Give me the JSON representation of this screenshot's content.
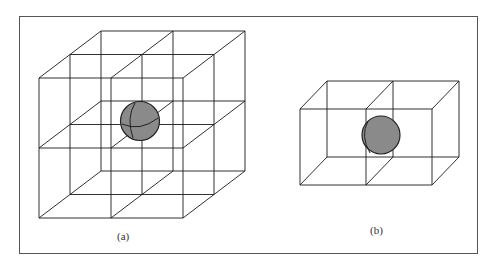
{
  "figure": {
    "panels": [
      {
        "id": "a",
        "caption": "(a)",
        "description": "2x2x2 cubic lattice with sphere at center vertex",
        "lattice": {
          "nx": 2,
          "ny": 2,
          "nz": 2
        },
        "sphere_fill": "#8a8a8a"
      },
      {
        "id": "b",
        "caption": "(b)",
        "description": "2x1x1 box with sphere at shared face",
        "lattice": {
          "nx": 2,
          "ny": 1,
          "nz": 1
        },
        "sphere_fill": "#8a8a8a"
      }
    ],
    "colors": {
      "line": "#1a1a1a",
      "frame": "#555555",
      "sphere": "#8a8a8a",
      "sphere_outline": "#222222"
    }
  }
}
